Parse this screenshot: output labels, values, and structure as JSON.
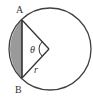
{
  "diagram": {
    "type": "circle-segment",
    "labels": {
      "point_a": "A",
      "point_b": "B",
      "angle": "θ",
      "radius": "r"
    },
    "colors": {
      "stroke": "#404040",
      "shaded_segment": "#9a9a9a",
      "background": "#ffffff"
    }
  }
}
